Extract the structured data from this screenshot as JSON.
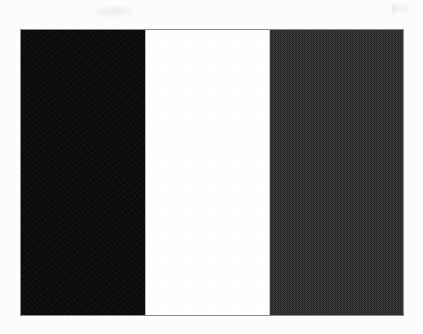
{
  "page": {
    "width": 423,
    "height": 334,
    "background_color": "#fdfdfd",
    "media": "scanned print page",
    "caption": ""
  },
  "artifacts": {
    "top_center_smudge": "scan-smudge",
    "top_right_smudge": "scan-smudge"
  },
  "flag": {
    "name": "vertical tricolour flag",
    "rendering": "black-and-white halftone scan",
    "orientation": "vertical bands",
    "band_count": 3,
    "outline_color": "#8c8c8c",
    "bounds": {
      "x": 21,
      "y": 30,
      "width": 382,
      "height": 285
    },
    "bands": [
      {
        "position": "hoist",
        "index": 1,
        "label": "black band",
        "color": "#0a0a0a",
        "tone": "black",
        "texture": "fine film grain",
        "width_px": 124
      },
      {
        "position": "middle",
        "index": 2,
        "label": "white band",
        "color": "#ffffff",
        "tone": "white",
        "texture": "clean",
        "width_px": 125
      },
      {
        "position": "fly",
        "index": 3,
        "label": "dark grey band",
        "color": "#262626",
        "tone": "dark grey",
        "texture": "checkerboard halftone dither",
        "width_px": 133
      }
    ]
  }
}
